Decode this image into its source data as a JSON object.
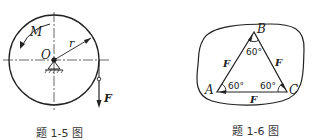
{
  "figures": [
    {
      "caption": "题 1-5 图",
      "labels": {
        "moment": "M",
        "radius": "r",
        "center": "O",
        "force": "F"
      }
    },
    {
      "caption": "题 1-6 图",
      "labels": {
        "vertex_a": "A",
        "vertex_b": "B",
        "vertex_c": "C",
        "side_ab": "F",
        "side_bc": "F",
        "side_ca": "F",
        "angle_a": "60°",
        "angle_b": "60°",
        "angle_c": "60°"
      }
    }
  ],
  "colors": {
    "ink": "#222222",
    "background": "#ffffff"
  }
}
